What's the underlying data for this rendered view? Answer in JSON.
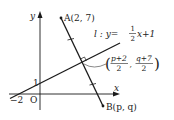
{
  "axes": {
    "x_label": "x",
    "y_label": "y",
    "origin_label": "O",
    "x_intercept_label": "−2",
    "y_intercept_label": "1"
  },
  "line_l": {
    "name": "l",
    "equation_prefix": "l : y=",
    "fraction_num": "1",
    "fraction_den": "2",
    "equation_suffix": "x+1"
  },
  "point_a": {
    "label": "A(2, 7)"
  },
  "point_b": {
    "label": "B(p, q)"
  },
  "midpoint": {
    "x_num": "p+2",
    "x_den": "2",
    "y_num": "q+7",
    "y_den": "2",
    "open_paren": "(",
    "close_paren": ")",
    "comma": ","
  },
  "colors": {
    "stroke": "#1a1a1a",
    "text": "#222222",
    "leader": "#555555"
  }
}
